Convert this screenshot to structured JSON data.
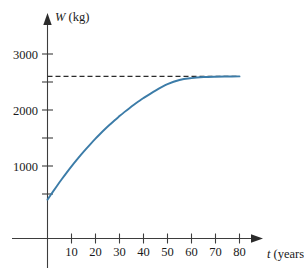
{
  "chart_data": {
    "type": "line",
    "title": "",
    "subtitle": "",
    "xlabel": "t (years)",
    "xlabel_variable": "t",
    "xlabel_unit": "(years)",
    "ylabel": "W (kg)",
    "ylabel_variable": "W",
    "ylabel_unit": "(kg)",
    "xlim": [
      0,
      90
    ],
    "ylim": [
      0,
      3250
    ],
    "grid": false,
    "legend": false,
    "legend_position": "none",
    "x_ticks_labeled": [
      10,
      20,
      30,
      40,
      50,
      60,
      70,
      80
    ],
    "x_tick_labels": [
      "10",
      "20",
      "30",
      "40",
      "50",
      "60",
      "70",
      "80"
    ],
    "x_tick_minor": [
      0,
      10,
      20,
      30,
      40,
      50,
      60,
      70,
      80
    ],
    "y_ticks_labeled": [
      1000,
      2000,
      3000
    ],
    "y_tick_labels": [
      "1000",
      "2000",
      "3000"
    ],
    "y_tick_minor": [
      500,
      1000,
      1500,
      2000,
      2500,
      3000
    ],
    "annotations": [
      {
        "name": "horizontal-asymptote",
        "kind": "dashed-horizontal-line",
        "y": 2600,
        "x_start": 0,
        "x_end": 80,
        "label": ""
      }
    ],
    "series": [
      {
        "name": "W(t)",
        "color": "#3c7ca8",
        "style": "solid",
        "x": [
          0,
          2,
          4,
          6,
          8,
          10,
          12,
          14,
          16,
          18,
          20,
          22,
          24,
          26,
          28,
          30,
          32,
          34,
          36,
          38,
          40,
          45,
          50,
          55,
          60,
          65,
          70,
          75,
          80
        ],
        "y": [
          400,
          525,
          648,
          767,
          882,
          993,
          1100,
          1203,
          1302,
          1397,
          1489,
          1576,
          1660,
          1740,
          1818,
          1891,
          1962,
          2029,
          2094,
          2155,
          2214,
          2347,
          2461,
          2536,
          2570,
          2588,
          2595,
          2598,
          2600
        ]
      }
    ]
  },
  "colors": {
    "curve": "#3c7ca8",
    "axis": "#3d3d3d",
    "text": "#1a1a1a",
    "asymptote": "#2b2b2b",
    "background": "#ffffff"
  }
}
